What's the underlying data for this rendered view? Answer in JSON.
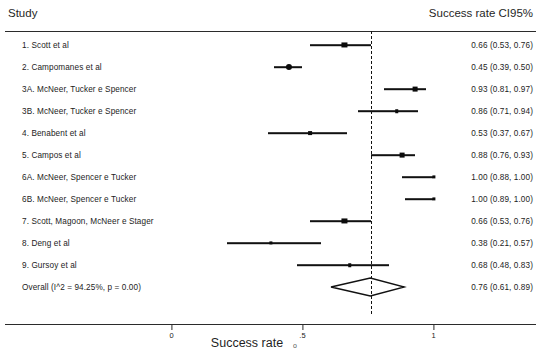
{
  "header": {
    "study_label": "Study",
    "effect_label": "Success rate CI95%"
  },
  "axis": {
    "title": "Success rate",
    "stray_artifact": "o",
    "ticks": [
      {
        "value": 0,
        "label": "0"
      },
      {
        "value": 0.5,
        "label": ".5"
      },
      {
        "value": 1,
        "label": "1"
      }
    ]
  },
  "chart_data": {
    "type": "forest",
    "title": "",
    "xlabel": "Success rate",
    "ylabel": "Study",
    "xlim": [
      -0.04,
      1.12
    ],
    "grid": false,
    "legend": "none",
    "effect_measure": "Success rate CI95%",
    "reference_line": 0.76,
    "heterogeneity": {
      "i_squared_pct": 94.25,
      "p_value": 0.0
    },
    "categories": [
      "1. Scott et al",
      "2. Campomanes et al",
      "3A. McNeer, Tucker e Spencer",
      "3B. McNeer, Tucker e Spencer",
      "4. Benabent et al",
      "5. Campos et al",
      "6A. McNeer, Spencer e Tucker",
      "6B. McNeer, Spencer e Tucker",
      "7. Scott, Magoon, McNeer e Stager",
      "8. Deng et al",
      "9. Gursoy et al"
    ],
    "values": [
      0.66,
      0.45,
      0.93,
      0.86,
      0.53,
      0.88,
      1.0,
      1.0,
      0.66,
      0.38,
      0.68
    ],
    "ci_lower": [
      0.53,
      0.39,
      0.81,
      0.71,
      0.37,
      0.76,
      0.88,
      0.89,
      0.53,
      0.21,
      0.48
    ],
    "ci_upper": [
      0.76,
      0.5,
      0.97,
      0.94,
      0.67,
      0.93,
      1.0,
      1.0,
      0.76,
      0.57,
      0.83
    ],
    "overall": {
      "label": "Overall  (I^2 = 94.25%, p = 0.00)",
      "value": 0.76,
      "ci_lower": 0.61,
      "ci_upper": 0.89,
      "estimate_text": "0.76 (0.61, 0.89)"
    }
  },
  "rows": [
    {
      "label": "1. Scott et al",
      "estimate": "0.66 (0.53, 0.76)",
      "value": 0.66,
      "lo": 0.53,
      "hi": 0.76,
      "weight": 5.2
    },
    {
      "label": "2. Campomanes et al",
      "estimate": "0.45 (0.39, 0.50)",
      "value": 0.45,
      "lo": 0.39,
      "hi": 0.5,
      "weight": 5.8
    },
    {
      "label": "3A. McNeer, Tucker e Spencer",
      "estimate": "0.93 (0.81, 0.97)",
      "value": 0.93,
      "lo": 0.81,
      "hi": 0.97,
      "weight": 5.0
    },
    {
      "label": "3B. McNeer, Tucker e Spencer",
      "estimate": "0.86 (0.71, 0.94)",
      "value": 0.86,
      "lo": 0.71,
      "hi": 0.94,
      "weight": 4.2
    },
    {
      "label": "4. Benabent et al",
      "estimate": "0.53 (0.37, 0.67)",
      "value": 0.53,
      "lo": 0.37,
      "hi": 0.67,
      "weight": 4.4
    },
    {
      "label": "5. Campos et al",
      "estimate": "0.88 (0.76, 0.93)",
      "value": 0.88,
      "lo": 0.76,
      "hi": 0.93,
      "weight": 5.0
    },
    {
      "label": "6A. McNeer, Spencer e Tucker",
      "estimate": "1.00 (0.88, 1.00)",
      "value": 1.0,
      "lo": 0.88,
      "hi": 1.0,
      "weight": 4.0
    },
    {
      "label": "6B. McNeer, Spencer e Tucker",
      "estimate": "1.00 (0.89, 1.00)",
      "value": 1.0,
      "lo": 0.89,
      "hi": 1.0,
      "weight": 4.0
    },
    {
      "label": "7. Scott, Magoon, McNeer e Stager",
      "estimate": "0.66 (0.53, 0.76)",
      "value": 0.66,
      "lo": 0.53,
      "hi": 0.76,
      "weight": 5.2
    },
    {
      "label": "8. Deng et al",
      "estimate": "0.38 (0.21, 0.57)",
      "value": 0.38,
      "lo": 0.21,
      "hi": 0.57,
      "weight": 4.0
    },
    {
      "label": "9. Gursoy et al",
      "estimate": "0.68 (0.48, 0.83)",
      "value": 0.68,
      "lo": 0.48,
      "hi": 0.83,
      "weight": 4.2
    },
    {
      "label": "Overall  (I^2 = 94.25%, p = 0.00)",
      "estimate": "0.76 (0.61, 0.89)",
      "value": 0.76,
      "lo": 0.61,
      "hi": 0.89,
      "weight": 0,
      "is_overall": true
    }
  ],
  "geometry": {
    "x0_px": 171.5,
    "x1_px": 433.5,
    "first_row_y": 45,
    "row_step": 22,
    "axis_y": 324
  },
  "colors": {
    "ink": "#111111",
    "rule": "#2b2b2b",
    "background": "#ffffff"
  }
}
